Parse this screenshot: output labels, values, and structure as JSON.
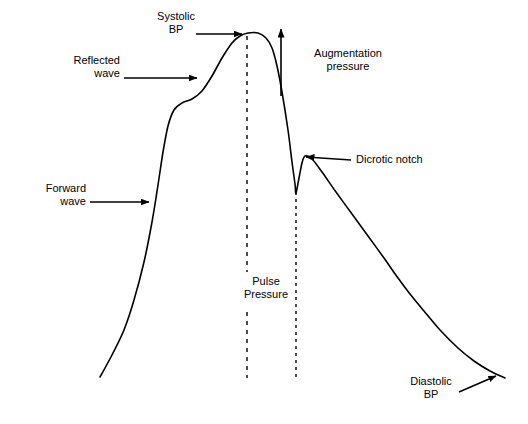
{
  "figure": {
    "background_color": "#ffffff",
    "stroke_color": "#000000"
  },
  "labels": {
    "systolic_bp": "Systolic\nBP",
    "reflected_wave": "Reflected\nwave",
    "forward_wave": "Forward\nwave",
    "augmentation_pressure": "Augmentation\npressure",
    "dicrotic_notch": "Dicrotic notch",
    "pulse_pressure": "Pulse\nPressure",
    "diastolic_bp": "Diastolic\nBP"
  },
  "chart_data": {
    "type": "line",
    "xlabel": "",
    "ylabel": "",
    "grid": false,
    "legend": "none",
    "xlim": [
      0,
      528
    ],
    "ylim": [
      0,
      424
    ],
    "series": [
      {
        "name": "Arterial pressure waveform",
        "points": [
          [
            100,
            377
          ],
          [
            112,
            355
          ],
          [
            124,
            330
          ],
          [
            134,
            300
          ],
          [
            144,
            262
          ],
          [
            152,
            222
          ],
          [
            158,
            185
          ],
          [
            163,
            152
          ],
          [
            168,
            126
          ],
          [
            174,
            110
          ],
          [
            182,
            103
          ],
          [
            192,
            99
          ],
          [
            202,
            91
          ],
          [
            212,
            76
          ],
          [
            222,
            58
          ],
          [
            232,
            43
          ],
          [
            240,
            36
          ],
          [
            248,
            33
          ],
          [
            258,
            33
          ],
          [
            266,
            38
          ],
          [
            272,
            48
          ],
          [
            277,
            66
          ],
          [
            282,
            92
          ],
          [
            288,
            130
          ],
          [
            292,
            162
          ],
          [
            295,
            184
          ],
          [
            296,
            193
          ],
          [
            299,
            178
          ],
          [
            302,
            163
          ],
          [
            305,
            156
          ],
          [
            312,
            159
          ],
          [
            322,
            172
          ],
          [
            336,
            192
          ],
          [
            352,
            214
          ],
          [
            368,
            236
          ],
          [
            384,
            258
          ],
          [
            398,
            278
          ],
          [
            410,
            294
          ],
          [
            424,
            311
          ],
          [
            440,
            330
          ],
          [
            458,
            348
          ],
          [
            474,
            361
          ],
          [
            490,
            371
          ],
          [
            505,
            378
          ]
        ]
      }
    ],
    "annotations": [
      {
        "name": "systolic-bp",
        "text": "Systolic BP",
        "marker": "arrow-right",
        "arrow_from": [
          196,
          34
        ],
        "arrow_to": [
          242,
          34
        ],
        "points_at": "waveform systolic peak"
      },
      {
        "name": "reflected-wave",
        "text": "Reflected wave",
        "marker": "arrow-right",
        "arrow_from": [
          124,
          78
        ],
        "arrow_to": [
          196,
          78
        ],
        "points_at": "reflected-wave shoulder on upstroke"
      },
      {
        "name": "forward-wave",
        "text": "Forward wave",
        "marker": "arrow-right",
        "arrow_from": [
          90,
          202
        ],
        "arrow_to": [
          148,
          202
        ],
        "points_at": "forward-wave steep upstroke"
      },
      {
        "name": "augmentation-pressure",
        "text": "Augmentation pressure",
        "marker": "arrow-up",
        "arrow_from": [
          281,
          96
        ],
        "arrow_to": [
          281,
          29
        ],
        "points_at": "pressure augmentation from systolic peak"
      },
      {
        "name": "dicrotic-notch",
        "text": "Dicrotic notch",
        "marker": "arrow-left",
        "arrow_from": [
          350,
          160
        ],
        "arrow_to": [
          306,
          158
        ],
        "points_at": "dicrotic notch on downstroke"
      },
      {
        "name": "diastolic-bp",
        "text": "Diastolic BP",
        "marker": "arrow-up-right",
        "arrow_from": [
          458,
          392
        ],
        "arrow_to": [
          494,
          377
        ],
        "points_at": "end-diastolic pressure"
      }
    ],
    "reference_lines": [
      {
        "name": "systolic-peak-dashed-line",
        "orientation": "vertical",
        "x": 247,
        "y_top": 36,
        "y_bottom": 378,
        "style": "dashed",
        "gap_top": 272,
        "gap_bottom": 312
      },
      {
        "name": "dicrotic-notch-dashed-line",
        "orientation": "vertical",
        "x": 296,
        "y_top": 192,
        "y_bottom": 378,
        "style": "dashed"
      }
    ],
    "measures": [
      {
        "name": "pulse-pressure",
        "text": "Pulse Pressure",
        "between": [
          "systolic-peak-dashed-line",
          "dicrotic-notch-dashed-line"
        ]
      }
    ]
  }
}
